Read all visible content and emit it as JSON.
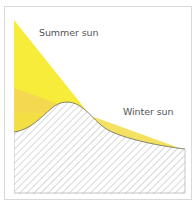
{
  "diagram": {
    "labels": {
      "summer": "Summer sun",
      "winter": "Winter sun"
    },
    "colors": {
      "summer_sun": "#f7ec3a",
      "winter_sun": "#f3dc3f",
      "overlap": "#f5d654",
      "terrain_line": "#6b6b5a",
      "hatch": "#9a9a9a",
      "frame": "#d9d9d9"
    }
  }
}
